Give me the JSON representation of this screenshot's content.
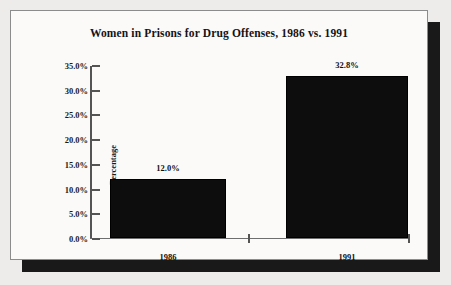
{
  "chart_data": {
    "type": "bar",
    "title": "Women in Prisons for Drug Offenses, 1986 vs. 1991",
    "categories": [
      "1986",
      "1991"
    ],
    "values": [
      12.0,
      32.8
    ],
    "data_labels": [
      "12.0%",
      "32.8%"
    ],
    "xlabel": "",
    "ylabel": "Percentage",
    "ylim": [
      0.0,
      35.0
    ],
    "ytick_values": [
      0.0,
      5.0,
      10.0,
      15.0,
      20.0,
      25.0,
      30.0,
      35.0
    ],
    "ytick_labels": [
      "0.0%",
      "5.0%",
      "10.0%",
      "15.0%",
      "20.0%",
      "25.0%",
      "30.0%",
      "35.0%"
    ],
    "grid": false,
    "legend": null,
    "bar_color": "#0d0d0d",
    "plot_background": "#fbfaf9",
    "axis_color": "#545454"
  },
  "frame": {
    "border_color": "#8c8c8c",
    "shadow_color": "#191919",
    "page_background": "#eeecea"
  }
}
